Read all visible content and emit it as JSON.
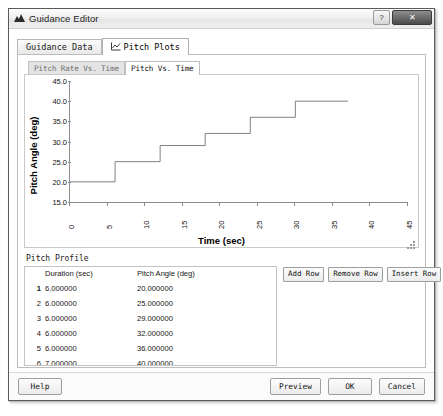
{
  "window": {
    "title": "Guidance Editor",
    "icon": "app-chart-icon",
    "help_button": "?",
    "close_button": "✕"
  },
  "outer_tabs": [
    {
      "label": "Guidance Data",
      "active": false,
      "icon": null
    },
    {
      "label": "Pitch Plots",
      "active": true,
      "icon": "line-chart-icon"
    }
  ],
  "inner_tabs": [
    {
      "label": "Pitch Rate Vs. Time",
      "active": false
    },
    {
      "label": "Pitch Vs. Time",
      "active": true
    }
  ],
  "chart_data": {
    "type": "line",
    "title": "",
    "xlabel": "Time (sec)",
    "ylabel": "Pitch Angle (deg)",
    "xlim": [
      0,
      45
    ],
    "ylim": [
      15.0,
      45.0
    ],
    "xticks": [
      0,
      5,
      10,
      15,
      20,
      25,
      30,
      35,
      40,
      45
    ],
    "xtick_labels": [
      "0",
      "5",
      "10",
      "15",
      "20",
      "25",
      "30",
      "35",
      "40",
      "45"
    ],
    "yticks": [
      15.0,
      20.0,
      25.0,
      30.0,
      35.0,
      40.0,
      45.0
    ],
    "ytick_labels": [
      "15.0",
      "20.0",
      "25.0",
      "30.0",
      "35.0",
      "40.0",
      "45.0"
    ],
    "grid": false,
    "legend": null,
    "line_color": "#808080",
    "step_style": "post",
    "series": [
      {
        "name": "Pitch Angle",
        "x": [
          0,
          6,
          6,
          12,
          12,
          18,
          18,
          24,
          24,
          30,
          30,
          37
        ],
        "y": [
          20,
          20,
          25,
          25,
          29,
          29,
          32,
          32,
          36,
          36,
          40,
          40
        ]
      }
    ]
  },
  "profile": {
    "section_label": "Pitch Profile",
    "columns": [
      "",
      "Duration (sec)",
      "Pitch Angle (deg)"
    ],
    "rows": [
      {
        "index": "1",
        "duration": "6.000000",
        "pitch": "20.000000",
        "selected": true
      },
      {
        "index": "2",
        "duration": "6.000000",
        "pitch": "25.000000",
        "selected": false
      },
      {
        "index": "3",
        "duration": "6.000000",
        "pitch": "29.000000",
        "selected": false
      },
      {
        "index": "4",
        "duration": "6.000000",
        "pitch": "32.000000",
        "selected": false
      },
      {
        "index": "5",
        "duration": "6.000000",
        "pitch": "36.000000",
        "selected": false
      },
      {
        "index": "6",
        "duration": "7.000000",
        "pitch": "40.000000",
        "selected": false
      }
    ],
    "buttons": [
      {
        "label": "Add Row"
      },
      {
        "label": "Remove Row"
      },
      {
        "label": "Insert Row"
      }
    ]
  },
  "footer": {
    "help": "Help",
    "preview": "Preview",
    "ok": "OK",
    "cancel": "Cancel"
  },
  "colors": {
    "window_bg": "#f3f3f3",
    "panel_bg": "#ffffff",
    "border": "#bdbdbd",
    "axis": "#8d8d8d",
    "line": "#808080",
    "text": "#121212"
  }
}
